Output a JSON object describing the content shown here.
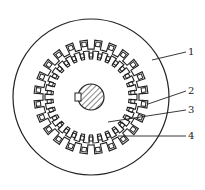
{
  "diagram": {
    "type": "motor-cross-section",
    "colors": {
      "stroke": "#222222",
      "background": "#ffffff",
      "hatch": "#333333"
    },
    "geometry": {
      "center": [
        91,
        97
      ],
      "outer_radius": 78,
      "stator_slot_radius": 56,
      "stator_slot_count": 24,
      "rotor_outer_radius": 46,
      "rotor_slot_count": 30,
      "shaft_radius": 13
    },
    "callouts": [
      {
        "id": "1",
        "label": "1",
        "from": [
          152,
          60
        ],
        "to": [
          186,
          52
        ],
        "text_pos": [
          188,
          47
        ]
      },
      {
        "id": "2",
        "label": "2",
        "from": [
          148,
          104
        ],
        "to": [
          186,
          91
        ],
        "text_pos": [
          188,
          86
        ]
      },
      {
        "id": "3",
        "label": "3",
        "from": [
          108,
          122
        ],
        "to": [
          186,
          110
        ],
        "text_pos": [
          188,
          105
        ]
      },
      {
        "id": "4",
        "label": "4",
        "from": [
          118,
          136
        ],
        "to": [
          186,
          136
        ],
        "text_pos": [
          188,
          131
        ]
      }
    ]
  }
}
